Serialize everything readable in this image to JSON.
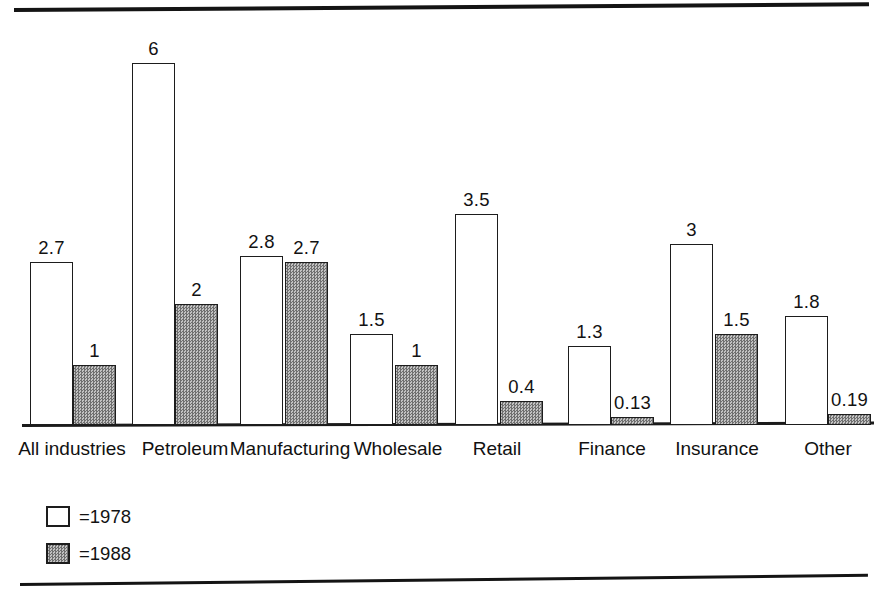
{
  "chart_data": {
    "type": "bar",
    "title": "",
    "subtitle": "",
    "xlabel": "",
    "ylabel": "",
    "ylim": [
      0,
      6
    ],
    "grid": false,
    "legend_position": "bottom-left",
    "categories": [
      "All industries",
      "Petroleum",
      "Manufacturing",
      "Wholesale",
      "Retail",
      "Finance",
      "Insurance",
      "Other"
    ],
    "series": [
      {
        "name": "=1978",
        "year": "1978",
        "swatch": "white",
        "values": [
          2.7,
          6,
          2.8,
          1.5,
          3.5,
          1.3,
          3,
          1.8
        ],
        "labels": [
          "2.7",
          "6",
          "2.8",
          "1.5",
          "3.5",
          "1.3",
          "3",
          "1.8"
        ]
      },
      {
        "name": "=1988",
        "year": "1988",
        "swatch": "gray",
        "values": [
          1,
          2,
          2.7,
          1,
          0.4,
          0.13,
          1.5,
          0.19
        ],
        "labels": [
          "1",
          "2",
          "2.7",
          "1",
          "0.4",
          "0.13",
          "1.5",
          "0.19"
        ]
      }
    ]
  },
  "legend": {
    "items": [
      {
        "label": "=1978",
        "swatch": "white"
      },
      {
        "label": "=1988",
        "swatch": "gray"
      }
    ]
  },
  "colors": {
    "ink": "#1d1d1d",
    "bar_1978_fill": "#ffffff",
    "bar_1988_fill": "#999999",
    "background": "#ffffff"
  }
}
